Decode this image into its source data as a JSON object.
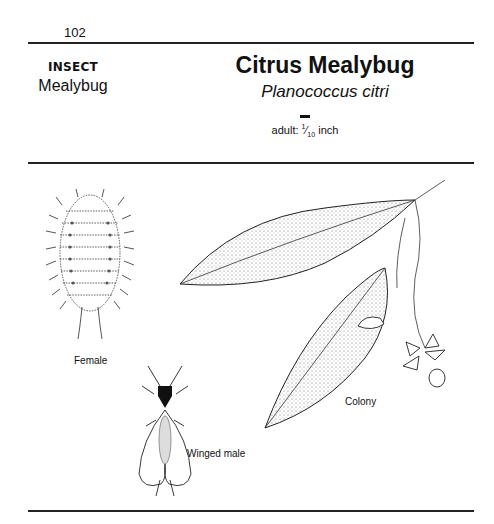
{
  "page": {
    "number": "102"
  },
  "header": {
    "category": "INSECT",
    "group": "Mealybug",
    "title": "Citrus Mealybug",
    "scientific_name": "Planococcus citri",
    "size_prefix": "adult: ",
    "size_numerator": "1",
    "size_denominator": "10",
    "size_unit": " inch"
  },
  "figures": [
    {
      "label": "Female",
      "icon": "female-mealybug-illustration"
    },
    {
      "label": "Winged male",
      "icon": "winged-male-mealybug-illustration"
    },
    {
      "label": "Colony",
      "icon": "citrus-leaf-colony-illustration"
    }
  ],
  "colors": {
    "ink": "#111111",
    "rule": "#222222",
    "background": "#ffffff"
  }
}
